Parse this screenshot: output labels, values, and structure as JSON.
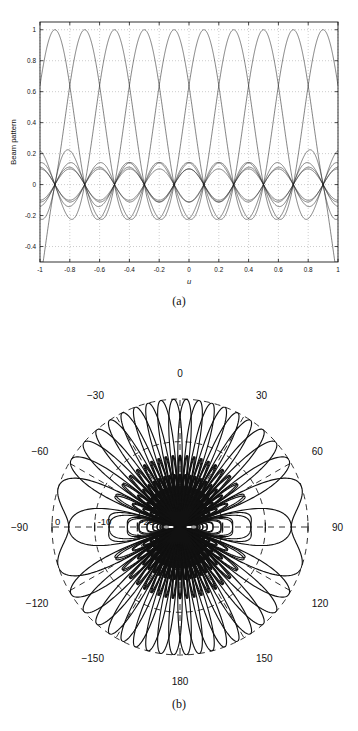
{
  "figure": {
    "panels": [
      {
        "id": "a",
        "caption": "(a)",
        "kind": "cartesian"
      },
      {
        "id": "b",
        "caption": "(b)",
        "kind": "polar"
      }
    ]
  },
  "chart_data": [
    {
      "type": "line",
      "panel": "a",
      "title": "",
      "xlabel": "u",
      "ylabel": "Beam pattern",
      "xlim": [
        -1,
        1
      ],
      "ylim": [
        -0.5,
        1.05
      ],
      "xticks": [
        -1,
        -0.8,
        -0.6,
        -0.4,
        -0.2,
        0,
        0.2,
        0.4,
        0.6,
        0.8,
        1
      ],
      "xticklabels": [
        "-1",
        "-0.8",
        "-0.6",
        "-0.4",
        "-0.2",
        "0",
        "0.2",
        "0.4",
        "0.6",
        "0.8",
        "1"
      ],
      "yticks": [
        -0.4,
        -0.2,
        0,
        0.2,
        0.4,
        0.6,
        0.8,
        1
      ],
      "yticklabels": [
        "-0.4",
        "-0.2",
        "0",
        "0.2",
        "0.4",
        "0.6",
        "0.8",
        "1"
      ],
      "grid": "dotted",
      "legend": "none",
      "description": "Overlaid conventional beam patterns of a uniform line array; main lobes of unit amplitude repeat across u and a dense family of sidelobe ridges lies between +0.15 and -0.22.",
      "series": [
        {
          "name": "envelope-main",
          "n_elements": 10,
          "peak": 1.0,
          "period_u": 0.2,
          "note": "interleaved main lobes reaching 1 at each beam-steer point"
        },
        {
          "name": "sidelobe-upper",
          "peak": 0.15,
          "period_u": 0.1
        },
        {
          "name": "sidelobe-mid",
          "peak": 0.1,
          "period_u": 0.1
        },
        {
          "name": "sidelobe-lower",
          "peak": -0.1,
          "period_u": 0.1
        },
        {
          "name": "sidelobe-min",
          "peak": -0.22,
          "period_u": 0.2
        }
      ],
      "n_curves": 10
    },
    {
      "type": "line",
      "panel": "b",
      "polar": true,
      "title": "",
      "rlabel": "dB",
      "rticks": [
        0,
        -10,
        -20
      ],
      "rticklabels": [
        "0",
        "-10",
        "-20"
      ],
      "rlim": [
        -30,
        0
      ],
      "thetaticks": [
        0,
        30,
        60,
        90,
        120,
        150,
        180,
        -150,
        -120,
        -90,
        -60,
        -30
      ],
      "thetaticklabels": [
        "0",
        "30",
        "60",
        "90",
        "120",
        "150",
        "180",
        "-150",
        "-120",
        "-90",
        "-60",
        "-30"
      ],
      "theta_zero_location": "N",
      "theta_direction": "clockwise",
      "grid": "dashed",
      "legend": "none",
      "description": "Polar plot in dB of the same beam family: about twenty beams fan out from the centre, each main lobe peaking at 0 dB on the outer circle, forming a rosette.",
      "n_beams": 20,
      "peak_db": 0,
      "beam_peak_angles_deg": [
        0,
        18,
        36,
        54,
        72,
        90,
        108,
        126,
        144,
        162,
        180,
        -162,
        -144,
        -126,
        -108,
        -90,
        -72,
        -54,
        -36,
        -18
      ]
    }
  ]
}
